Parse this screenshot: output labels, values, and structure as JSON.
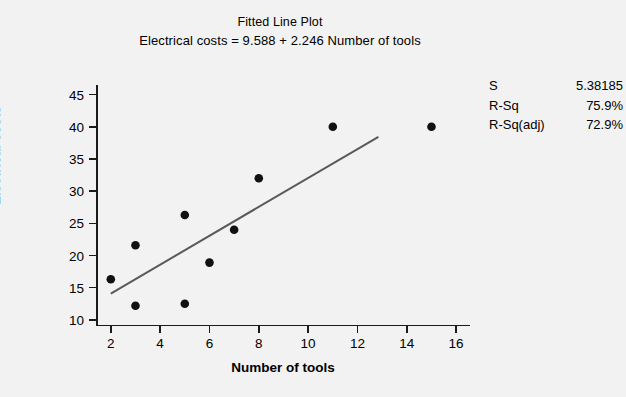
{
  "chart_data": {
    "type": "scatter",
    "title": "Fitted Line Plot",
    "subtitle": "Electrical costs = 9.588 + 2.246 Number of tools",
    "xlabel": "Number of tools",
    "ylabel": "Electrical costs",
    "xlim": [
      1.4,
      16.4
    ],
    "ylim": [
      9.2,
      46.5
    ],
    "xticks": [
      2,
      4,
      6,
      8,
      10,
      12,
      14,
      16
    ],
    "yticks": [
      10,
      15,
      20,
      25,
      30,
      35,
      40,
      45
    ],
    "grid": false,
    "legend": false,
    "x": [
      2,
      3,
      3,
      5,
      5,
      6,
      7,
      8,
      11,
      15
    ],
    "y": [
      16.3,
      21.6,
      12.2,
      26.3,
      12.5,
      18.9,
      24.0,
      32.0,
      40.0,
      40.0
    ],
    "points": [
      {
        "x": 2,
        "y": 16.3
      },
      {
        "x": 3,
        "y": 21.6
      },
      {
        "x": 3,
        "y": 12.2
      },
      {
        "x": 5,
        "y": 26.3
      },
      {
        "x": 5,
        "y": 12.5
      },
      {
        "x": 6,
        "y": 18.9
      },
      {
        "x": 7,
        "y": 24.0
      },
      {
        "x": 8,
        "y": 32.0
      },
      {
        "x": 11,
        "y": 40.0
      },
      {
        "x": 15,
        "y": 40.0
      }
    ],
    "fit_line": {
      "intercept": 9.588,
      "slope": 2.246,
      "x_start": 2.0,
      "x_end": 12.85,
      "color": "#595959"
    },
    "marker_color": "#111111",
    "background": "#f2f2f2"
  },
  "stats": {
    "rows": [
      {
        "key": "S",
        "value": "5.38185"
      },
      {
        "key": "R-Sq",
        "value": "75.9%"
      },
      {
        "key": "R-Sq(adj)",
        "value": "72.9%"
      }
    ]
  },
  "ticks": {
    "y": [
      "45",
      "40",
      "35",
      "30",
      "25",
      "20",
      "15",
      "10"
    ],
    "x": [
      "2",
      "4",
      "6",
      "8",
      "10",
      "12",
      "14",
      "16"
    ]
  }
}
